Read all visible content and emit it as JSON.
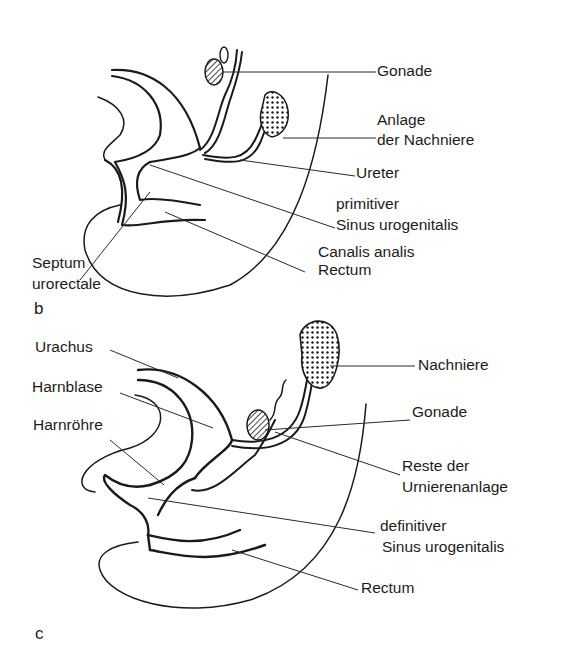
{
  "figure": {
    "panels": [
      {
        "id": "b",
        "letter": "b",
        "labels": {
          "gonade": "Gonade",
          "anlage_line1": "Anlage",
          "anlage_line2": "der Nachniere",
          "ureter": "Ureter",
          "sinus_line1": "primitiver",
          "sinus_line2": "Sinus urogenitalis",
          "canalis_line1": "Canalis analis",
          "canalis_line2": "Rectum",
          "septum_line1": "Septum",
          "septum_line2": "urorectale"
        }
      },
      {
        "id": "c",
        "letter": "c",
        "labels": {
          "urachus": "Urachus",
          "harnblase": "Harnblase",
          "harnroehre": "Harnröhre",
          "nachniere": "Nachniere",
          "gonade": "Gonade",
          "reste_line1": "Reste der",
          "reste_line2": "Urnierenanlage",
          "sinus_line1": "definitiver",
          "sinus_line2": "Sinus urogenitalis",
          "rectum": "Rectum"
        }
      }
    ]
  }
}
